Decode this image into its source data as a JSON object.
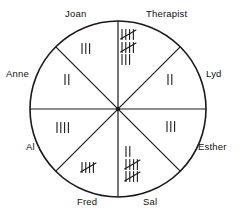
{
  "figure": {
    "name": "tally-circle-chart",
    "caption": ""
  },
  "chart_data": {
    "type": "pie",
    "title": "",
    "xlabel": "",
    "ylabel": "",
    "legend_position": "around-circle",
    "grid": false,
    "note": "Circle divided into 8 equal sectors; each sector labeled with a person's name and filled with tally marks.",
    "categories": [
      "Therapist",
      "Lyd",
      "Esther",
      "Sal",
      "Fred",
      "Al",
      "Anne",
      "Joan"
    ],
    "values": [
      13,
      2,
      3,
      12,
      5,
      4,
      2,
      3
    ],
    "sectors": [
      {
        "label": "Therapist",
        "count": 13,
        "tally_lines": [
          5,
          5,
          3
        ],
        "label_x": 146,
        "label_y": 8,
        "tally_x": 120,
        "tally_y": 28
      },
      {
        "label": "Lyd",
        "count": 2,
        "tally_lines": [
          2
        ],
        "label_x": 206,
        "label_y": 68,
        "tally_x": 166,
        "tally_y": 73
      },
      {
        "label": "Esther",
        "count": 3,
        "tally_lines": [
          3
        ],
        "label_x": 198,
        "label_y": 141,
        "tally_x": 165,
        "tally_y": 120
      },
      {
        "label": "Sal",
        "count": 12,
        "tally_lines": [
          2,
          5,
          5
        ],
        "label_x": 143,
        "label_y": 196,
        "tally_x": 124,
        "tally_y": 145
      },
      {
        "label": "Fred",
        "count": 5,
        "tally_lines": [
          5
        ],
        "label_x": 77,
        "label_y": 196,
        "tally_x": 80,
        "tally_y": 161
      },
      {
        "label": "Al",
        "count": 4,
        "tally_lines": [
          4
        ],
        "label_x": 26,
        "label_y": 141,
        "tally_x": 55,
        "tally_y": 121
      },
      {
        "label": "Anne",
        "count": 2,
        "tally_lines": [
          2
        ],
        "label_x": 6,
        "label_y": 68,
        "tally_x": 63,
        "tally_y": 73
      },
      {
        "label": "Joan",
        "count": 3,
        "tally_lines": [
          3
        ],
        "label_x": 65,
        "label_y": 8,
        "tally_x": 80,
        "tally_y": 42
      }
    ],
    "geometry": {
      "center_x": 118,
      "center_y": 109,
      "radius": 88,
      "divider_count": 4
    },
    "colors": {
      "stroke": "#1a1a1a",
      "background": "#ffffff",
      "text": "#111111"
    }
  }
}
